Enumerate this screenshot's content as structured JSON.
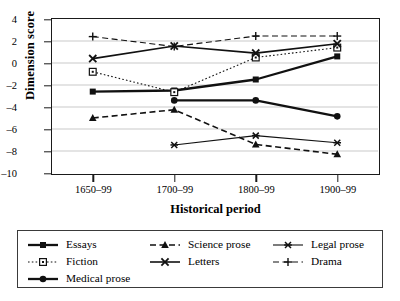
{
  "chart_data": {
    "type": "line",
    "title": "",
    "xlabel": "Historical period",
    "ylabel": "Dimension score",
    "categories": [
      "1650–99",
      "1700–99",
      "1800–99",
      "1900–99"
    ],
    "ylim": [
      -10,
      4
    ],
    "yticks": [
      4,
      2,
      0,
      -2,
      -4,
      -6,
      -8,
      -10
    ],
    "ytick_labels": [
      "4",
      "2",
      "0",
      "–2",
      "–4",
      "–6",
      "–8",
      "–10"
    ],
    "grid": true,
    "grid_axis": "y",
    "legend_position": "bottom",
    "series": [
      {
        "name": "Essays",
        "marker": "filled-square",
        "line": "solid",
        "width": "thick",
        "values": [
          -2.6,
          -2.5,
          -1.5,
          0.6
        ]
      },
      {
        "name": "Fiction",
        "marker": "open-square",
        "line": "dotted",
        "width": "thin",
        "values": [
          -0.8,
          -2.65,
          0.5,
          1.4
        ]
      },
      {
        "name": "Medical prose",
        "marker": "filled-circle",
        "line": "solid",
        "width": "thick",
        "values": [
          null,
          -3.4,
          -3.4,
          -4.85
        ]
      },
      {
        "name": "Science prose",
        "marker": "filled-triangle",
        "line": "dashed",
        "width": "medium",
        "values": [
          -5.0,
          -4.25,
          -7.4,
          -8.3
        ]
      },
      {
        "name": "Letters",
        "marker": "x-cross",
        "line": "solid",
        "width": "medium",
        "values": [
          0.4,
          1.55,
          0.9,
          1.75
        ]
      },
      {
        "name": "Legal prose",
        "marker": "asterisk",
        "line": "solid",
        "width": "thin",
        "values": [
          null,
          -7.45,
          -6.6,
          -7.25
        ]
      },
      {
        "name": "Drama",
        "marker": "plus",
        "line": "dashed",
        "width": "thin",
        "values": [
          2.4,
          1.5,
          2.45,
          2.45
        ]
      }
    ]
  },
  "legend": {
    "items": [
      {
        "label": "Essays"
      },
      {
        "label": "Science prose"
      },
      {
        "label": "Legal prose"
      },
      {
        "label": "Fiction"
      },
      {
        "label": "Letters"
      },
      {
        "label": "Drama"
      },
      {
        "label": "Medical prose"
      }
    ]
  },
  "colors": {
    "line": "#111111",
    "axis": "#1a1a1a",
    "grid": "#c9c9c9",
    "background": "#ffffff"
  }
}
